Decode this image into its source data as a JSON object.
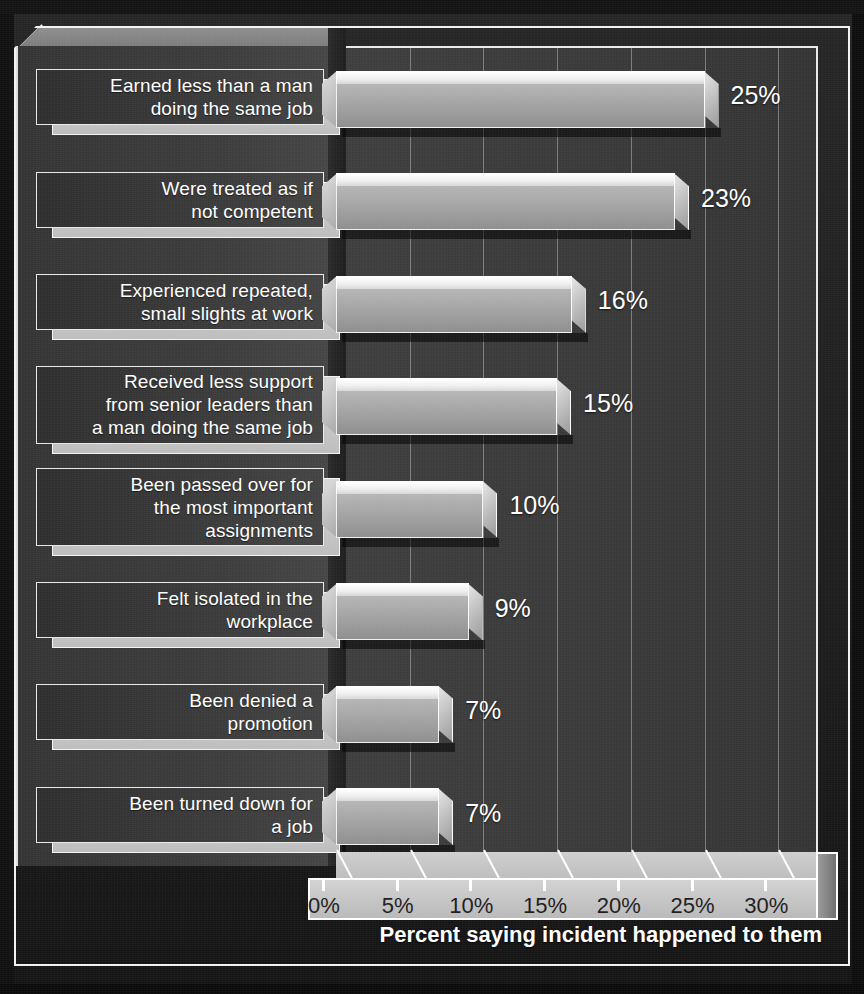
{
  "chart_data": {
    "type": "bar",
    "orientation": "horizontal",
    "title": "",
    "xlabel": "Percent saying incident happened to them",
    "ylabel": "",
    "xlim": [
      0,
      32
    ],
    "grid": true,
    "legend": false,
    "categories": [
      "Earned less than a man\ndoing the same job",
      "Were treated as if\nnot competent",
      "Experienced repeated,\nsmall slights at work",
      "Received less support\nfrom senior leaders than\na man doing the same job",
      "Been passed over for\nthe most important\nassignments",
      "Felt isolated in the\nworkplace",
      "Been denied a\npromotion",
      "Been turned down for\na job"
    ],
    "values": [
      25,
      23,
      16,
      15,
      10,
      9,
      7,
      7
    ],
    "value_labels": [
      "25%",
      "23%",
      "16%",
      "15%",
      "10%",
      "9%",
      "7%",
      "7%"
    ],
    "xticks": [
      0,
      5,
      10,
      15,
      20,
      25,
      30
    ],
    "xtick_labels": [
      "0%",
      "5%",
      "10%",
      "15%",
      "20%",
      "25%",
      "30%"
    ]
  },
  "axis": {
    "caption": "Percent saying incident happened to them"
  },
  "colors": {
    "background": "#1e1e1e",
    "plot_wall": "#3a3a3a",
    "bar_face": "#a2a2a2",
    "bar_top": "#f0f0f0",
    "label_box": "#3a3a3a",
    "label_plate": "#c8c8c8",
    "frame": "#f2f2f2",
    "value_text": "#ffffff",
    "tick_text": "#1d1d1d"
  }
}
